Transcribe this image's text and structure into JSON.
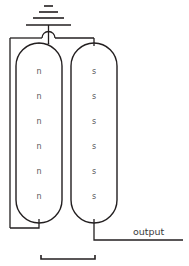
{
  "diagram": {
    "background_color": "#ffffff",
    "line_color": "#231f20",
    "carrier_text_color": "#58595b",
    "label_text_color": "#3b3b3d",
    "ground_symbol": {
      "name": "ground",
      "bars": 3
    },
    "left_region": {
      "name": "n-region",
      "carrier_label": "n",
      "carrier_count": 6,
      "carriers": [
        "n",
        "n",
        "n",
        "n",
        "n",
        "n"
      ]
    },
    "right_region": {
      "name": "s-region",
      "carrier_label": "s",
      "carrier_count": 6,
      "carriers": [
        "s",
        "s",
        "s",
        "s",
        "s",
        "s"
      ]
    },
    "output": {
      "label": "output"
    },
    "scale_bar": {
      "label": ""
    }
  }
}
